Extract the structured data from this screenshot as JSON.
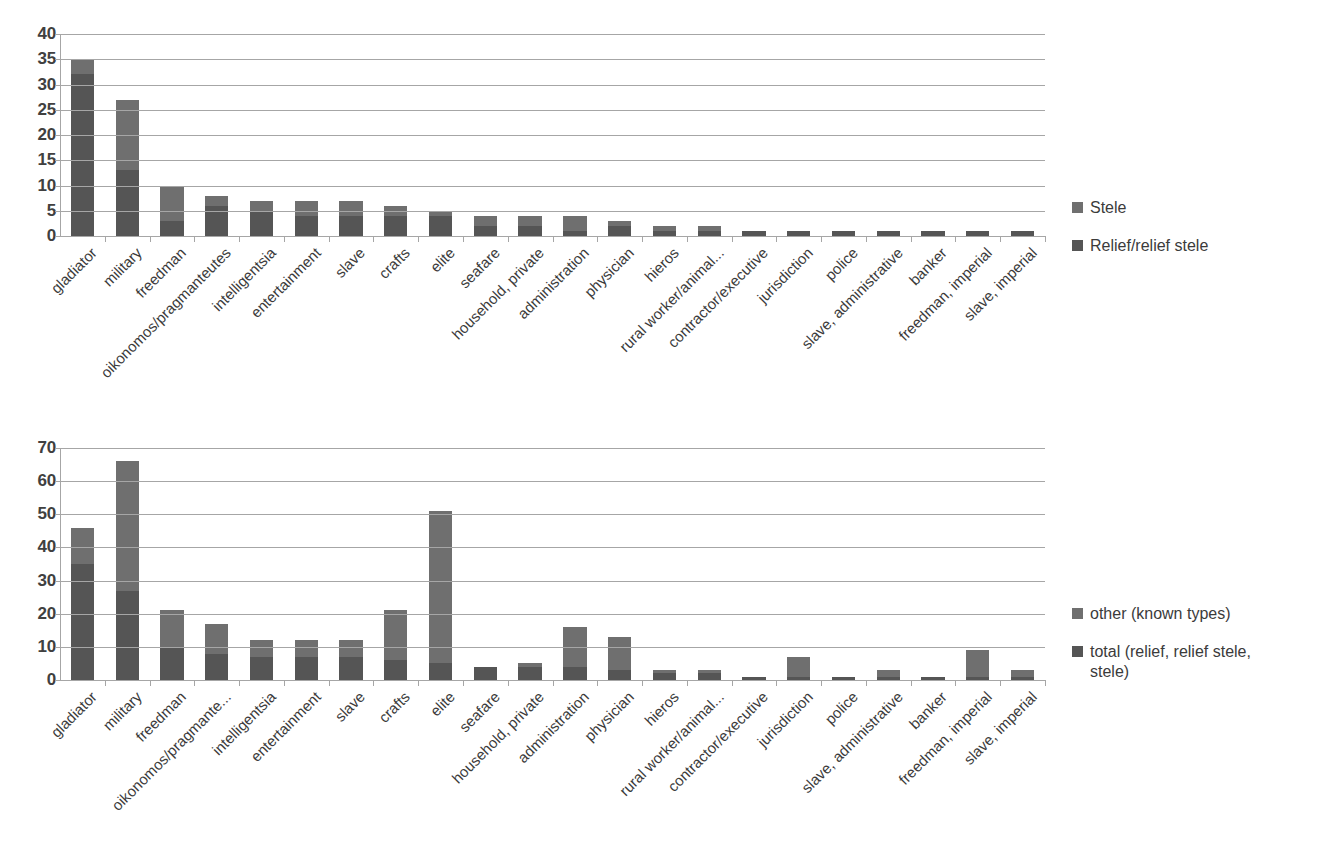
{
  "chart_data": [
    {
      "id": "chart-top",
      "type": "bar",
      "stacked": true,
      "title": "",
      "xlabel": "",
      "ylabel": "",
      "ylim": [
        0,
        40
      ],
      "ytick_step": 5,
      "yticks": [
        "0",
        "5",
        "10",
        "15",
        "20",
        "25",
        "30",
        "35",
        "40"
      ],
      "grid": true,
      "legend_position": "right",
      "categories": [
        "gladiator",
        "military",
        "freedman",
        "oikonomos/pragmanteutes",
        "intelligentsia",
        "entertainment",
        "slave",
        "crafts",
        "elite",
        "seafare",
        "household, private",
        "administration",
        "physician",
        "hieros",
        "rural worker/animal...",
        "contractor/executive",
        "jurisdiction",
        "police",
        "slave, administrative",
        "banker",
        "freedman, imperial",
        "slave, imperial"
      ],
      "series": [
        {
          "name": "Relief/relief stele",
          "color": "#555555",
          "values": [
            32,
            13,
            3,
            6,
            5,
            4,
            4,
            4,
            4,
            2,
            2,
            1,
            2,
            1,
            1,
            1,
            1,
            1,
            1,
            1,
            1,
            1
          ]
        },
        {
          "name": "Stele",
          "color": "#6f6f6f",
          "values": [
            3,
            14,
            7,
            2,
            2,
            3,
            3,
            2,
            1,
            2,
            2,
            3,
            1,
            1,
            1,
            0,
            0,
            0,
            0,
            0,
            0,
            0
          ]
        }
      ],
      "totals": [
        35,
        27,
        10,
        8,
        7,
        7,
        7,
        6,
        5,
        4,
        4,
        4,
        3,
        2,
        2,
        1,
        1,
        1,
        1,
        1,
        1,
        1
      ]
    },
    {
      "id": "chart-bottom",
      "type": "bar",
      "stacked": true,
      "title": "",
      "xlabel": "",
      "ylabel": "",
      "ylim": [
        0,
        70
      ],
      "ytick_step": 10,
      "yticks": [
        "0",
        "10",
        "20",
        "30",
        "40",
        "50",
        "60",
        "70"
      ],
      "grid": true,
      "legend_position": "right",
      "categories": [
        "gladiator",
        "military",
        "freedman",
        "oikonomos/pragmante...",
        "intelligentsia",
        "entertainment",
        "slave",
        "crafts",
        "elite",
        "seafare",
        "household, private",
        "administration",
        "physician",
        "hieros",
        "rural worker/animal...",
        "contractor/executive",
        "jurisdiction",
        "police",
        "slave, administrative",
        "banker",
        "freedman, imperial",
        "slave, imperial"
      ],
      "series": [
        {
          "name": "total (relief, relief stele, stele)",
          "color": "#555555",
          "values": [
            35,
            27,
            10,
            8,
            7,
            7,
            7,
            6,
            5,
            4,
            4,
            4,
            3,
            2,
            2,
            1,
            1,
            1,
            1,
            1,
            1,
            1
          ]
        },
        {
          "name": "other (known types)",
          "color": "#6f6f6f",
          "values": [
            11,
            39,
            11,
            9,
            5,
            5,
            5,
            15,
            46,
            0,
            1,
            12,
            10,
            1,
            1,
            0,
            6,
            0,
            2,
            0,
            8,
            2
          ]
        }
      ],
      "totals": [
        46,
        66,
        21,
        17,
        12,
        12,
        12,
        21,
        51,
        4,
        5,
        16,
        13,
        3,
        3,
        1,
        7,
        1,
        3,
        1,
        9,
        3
      ]
    }
  ],
  "legends": {
    "top": [
      {
        "label": "Stele",
        "color": "#6f6f6f"
      },
      {
        "label": "Relief/relief stele",
        "color": "#555555"
      }
    ],
    "bottom": [
      {
        "label": "other (known types)",
        "color": "#6f6f6f"
      },
      {
        "label": "total (relief, relief stele, stele)",
        "color": "#555555"
      }
    ]
  },
  "caption": ""
}
